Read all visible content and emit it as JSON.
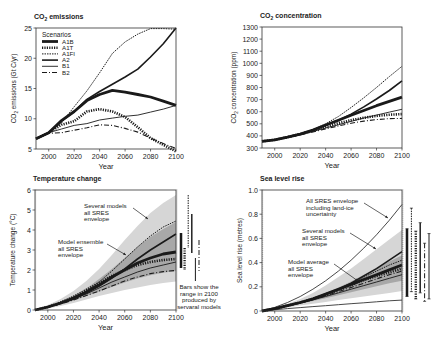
{
  "chart_data": [
    {
      "id": "co2_emissions",
      "type": "line",
      "title": "CO2 emissions",
      "xlabel": "Year",
      "ylabel": "CO2 emissions (Gt C/yr)",
      "xlim": [
        1990,
        2100
      ],
      "ylim": [
        5,
        25
      ],
      "xticks": [
        2000,
        2020,
        2040,
        2060,
        2080,
        2100
      ],
      "yticks": [
        5,
        10,
        15,
        20,
        25
      ],
      "legend": {
        "title": "Scenarios",
        "position": "upper left",
        "entries": [
          "A1B",
          "A1T",
          "A1FI",
          "A2",
          "B1",
          "B2"
        ]
      },
      "x": [
        1990,
        2000,
        2010,
        2020,
        2030,
        2040,
        2050,
        2060,
        2070,
        2080,
        2090,
        2100
      ],
      "series": [
        {
          "name": "A1B",
          "style": "thick-solid",
          "values": [
            6.7,
            7.7,
            9.7,
            11.2,
            13.0,
            14.0,
            14.7,
            14.4,
            14.0,
            13.6,
            12.9,
            12.2
          ]
        },
        {
          "name": "A1T",
          "style": "thick-dotted",
          "values": [
            6.7,
            7.7,
            9.0,
            9.6,
            11.2,
            11.6,
            11.2,
            10.3,
            8.6,
            6.8,
            5.7,
            4.6
          ]
        },
        {
          "name": "A1FI",
          "style": "thin-dotted",
          "values": [
            6.7,
            7.7,
            9.3,
            12.0,
            14.6,
            17.6,
            20.8,
            22.7,
            24.0,
            24.9,
            24.9,
            24.8
          ]
        },
        {
          "name": "A2",
          "style": "solid",
          "values": [
            6.7,
            7.7,
            9.6,
            11.2,
            13.2,
            14.5,
            15.7,
            16.9,
            18.2,
            20.2,
            22.4,
            25.0
          ]
        },
        {
          "name": "B1",
          "style": "thin-solid",
          "values": [
            6.7,
            7.7,
            8.3,
            8.9,
            9.2,
            9.8,
            10.1,
            10.4,
            10.6,
            11.1,
            11.6,
            12.2
          ]
        },
        {
          "name": "B2",
          "style": "dash-dot",
          "values": [
            6.7,
            7.6,
            7.7,
            8.1,
            8.5,
            9.0,
            8.9,
            8.4,
            7.8,
            6.8,
            5.9,
            5.1
          ]
        }
      ]
    },
    {
      "id": "co2_concentration",
      "type": "line",
      "title": "CO2 concentration",
      "xlabel": "Year",
      "ylabel": "CO2 concentration (ppm)",
      "xlim": [
        1990,
        2100
      ],
      "ylim": [
        300,
        1300
      ],
      "xticks": [
        2000,
        2020,
        2040,
        2060,
        2080,
        2100
      ],
      "yticks": [
        300,
        400,
        500,
        600,
        700,
        800,
        900,
        1000,
        1100,
        1200,
        1300
      ],
      "x": [
        1990,
        2000,
        2010,
        2020,
        2030,
        2040,
        2050,
        2060,
        2070,
        2080,
        2090,
        2100
      ],
      "series": [
        {
          "name": "A1B",
          "style": "thick-solid",
          "values": [
            355,
            368,
            390,
            415,
            448,
            490,
            530,
            570,
            610,
            650,
            685,
            720
          ]
        },
        {
          "name": "A1T",
          "style": "thick-dotted",
          "values": [
            355,
            368,
            390,
            415,
            445,
            475,
            505,
            530,
            550,
            565,
            575,
            580
          ]
        },
        {
          "name": "A1FI",
          "style": "thin-dotted",
          "values": [
            355,
            368,
            390,
            415,
            450,
            500,
            560,
            635,
            715,
            800,
            890,
            975
          ]
        },
        {
          "name": "A2",
          "style": "solid",
          "values": [
            355,
            368,
            390,
            415,
            448,
            488,
            530,
            580,
            640,
            705,
            775,
            855
          ]
        },
        {
          "name": "B1",
          "style": "thin-solid",
          "values": [
            355,
            368,
            388,
            410,
            437,
            465,
            492,
            520,
            548,
            572,
            597,
            620
          ]
        },
        {
          "name": "B2",
          "style": "dash-dot",
          "values": [
            355,
            368,
            387,
            408,
            432,
            458,
            482,
            505,
            522,
            535,
            543,
            545
          ]
        }
      ]
    },
    {
      "id": "temperature_change",
      "type": "line",
      "title": "Temperature change",
      "xlabel": "Year",
      "ylabel": "Temperature change (°C)",
      "xlim": [
        1990,
        2100
      ],
      "ylim": [
        0,
        6
      ],
      "xticks": [
        2000,
        2020,
        2040,
        2060,
        2080,
        2100
      ],
      "yticks": [
        0,
        1,
        2,
        3,
        4,
        5,
        6
      ],
      "x": [
        1990,
        2000,
        2010,
        2020,
        2030,
        2040,
        2050,
        2060,
        2070,
        2080,
        2090,
        2100
      ],
      "series": [
        {
          "name": "A1B",
          "style": "thick-solid",
          "values": [
            0,
            0.15,
            0.35,
            0.6,
            0.9,
            1.25,
            1.65,
            2.0,
            2.35,
            2.6,
            2.8,
            2.9
          ]
        },
        {
          "name": "A1T",
          "style": "thick-dotted",
          "values": [
            0,
            0.15,
            0.37,
            0.65,
            1.0,
            1.35,
            1.7,
            2.0,
            2.25,
            2.4,
            2.5,
            2.55
          ]
        },
        {
          "name": "A1FI",
          "style": "thin-dotted",
          "values": [
            0,
            0.15,
            0.35,
            0.6,
            0.95,
            1.4,
            1.95,
            2.55,
            3.15,
            3.7,
            4.15,
            4.45
          ]
        },
        {
          "name": "A2",
          "style": "solid",
          "values": [
            0,
            0.15,
            0.33,
            0.55,
            0.85,
            1.2,
            1.6,
            2.05,
            2.55,
            3.0,
            3.4,
            3.8
          ]
        },
        {
          "name": "B1",
          "style": "thin-solid",
          "values": [
            0,
            0.15,
            0.33,
            0.55,
            0.8,
            1.1,
            1.4,
            1.65,
            1.9,
            2.1,
            2.25,
            2.4
          ]
        },
        {
          "name": "B2",
          "style": "dash-dot",
          "values": [
            0,
            0.13,
            0.3,
            0.5,
            0.72,
            0.95,
            1.2,
            1.45,
            1.65,
            1.82,
            1.92,
            1.98
          ]
        }
      ],
      "envelopes": [
        {
          "name": "Several models all SRES envelope",
          "fill": "#d6d6d6",
          "upper": [
            0,
            0.25,
            0.55,
            0.95,
            1.45,
            2.05,
            2.75,
            3.5,
            4.2,
            4.85,
            5.35,
            5.75
          ],
          "lower": [
            0,
            0.08,
            0.2,
            0.35,
            0.52,
            0.7,
            0.85,
            1.0,
            1.12,
            1.25,
            1.35,
            1.42
          ]
        },
        {
          "name": "Model ensemble all SRES envelope",
          "fill": "#a8a8a8",
          "upper": [
            0,
            0.18,
            0.42,
            0.72,
            1.08,
            1.55,
            2.05,
            2.6,
            3.15,
            3.65,
            4.05,
            4.4
          ],
          "lower": [
            0,
            0.12,
            0.28,
            0.48,
            0.7,
            0.92,
            1.15,
            1.38,
            1.57,
            1.74,
            1.86,
            1.95
          ]
        }
      ],
      "range_bars_2100": [
        {
          "name": "A1B",
          "style": "thick-solid",
          "min": 2.1,
          "max": 3.85
        },
        {
          "name": "A1T",
          "style": "thick-dotted",
          "min": 2.0,
          "max": 3.1
        },
        {
          "name": "A1FI",
          "style": "thin-dotted",
          "min": 3.1,
          "max": 5.75
        },
        {
          "name": "A2",
          "style": "solid",
          "min": 2.85,
          "max": 4.8
        },
        {
          "name": "B1",
          "style": "thin-solid",
          "min": 1.45,
          "max": 2.6
        },
        {
          "name": "B2",
          "style": "dash-dot",
          "min": 1.95,
          "max": 3.5
        }
      ],
      "annotations": [
        "Several models all SRES envelope",
        "Model ensemble all SRES envelope",
        "Bars show the range in 2100 produced by servaral models"
      ]
    },
    {
      "id": "sea_level_rise",
      "type": "line",
      "title": "Sea level rise",
      "xlabel": "Year",
      "ylabel": "Sea level rise (metres)",
      "xlim": [
        1990,
        2100
      ],
      "ylim": [
        0,
        1.0
      ],
      "xticks": [
        2000,
        2020,
        2040,
        2060,
        2080,
        2100
      ],
      "yticks": [
        0,
        0.2,
        0.4,
        0.6,
        0.8,
        1.0
      ],
      "x": [
        1990,
        2000,
        2010,
        2020,
        2030,
        2040,
        2050,
        2060,
        2070,
        2080,
        2090,
        2100
      ],
      "series": [
        {
          "name": "A1B",
          "style": "thick-solid",
          "values": [
            0,
            0.02,
            0.045,
            0.07,
            0.1,
            0.14,
            0.18,
            0.22,
            0.26,
            0.3,
            0.34,
            0.38
          ]
        },
        {
          "name": "A1T",
          "style": "thick-dotted",
          "values": [
            0,
            0.02,
            0.045,
            0.07,
            0.1,
            0.135,
            0.175,
            0.215,
            0.255,
            0.29,
            0.32,
            0.35
          ]
        },
        {
          "name": "A1FI",
          "style": "thin-dotted",
          "values": [
            0,
            0.02,
            0.045,
            0.07,
            0.1,
            0.14,
            0.18,
            0.23,
            0.28,
            0.33,
            0.38,
            0.42
          ]
        },
        {
          "name": "A2",
          "style": "solid",
          "values": [
            0,
            0.02,
            0.045,
            0.07,
            0.1,
            0.14,
            0.18,
            0.23,
            0.29,
            0.35,
            0.42,
            0.49
          ]
        },
        {
          "name": "B1",
          "style": "thin-solid",
          "values": [
            0,
            0.02,
            0.042,
            0.065,
            0.092,
            0.12,
            0.15,
            0.18,
            0.21,
            0.24,
            0.27,
            0.3
          ]
        },
        {
          "name": "B2",
          "style": "dash-dot",
          "values": [
            0,
            0.02,
            0.043,
            0.068,
            0.095,
            0.125,
            0.16,
            0.195,
            0.23,
            0.265,
            0.3,
            0.33
          ]
        }
      ],
      "envelopes": [
        {
          "name": "Several models all SRES envelope",
          "fill": "#d6d6d6",
          "upper": [
            0,
            0.03,
            0.06,
            0.1,
            0.15,
            0.21,
            0.28,
            0.35,
            0.43,
            0.51,
            0.59,
            0.67
          ],
          "lower": [
            0,
            0.015,
            0.03,
            0.045,
            0.06,
            0.075,
            0.09,
            0.105,
            0.12,
            0.135,
            0.15,
            0.165
          ]
        },
        {
          "name": "Model average all SRES envelope",
          "fill": "#a8a8a8",
          "upper": [
            0,
            0.022,
            0.048,
            0.076,
            0.108,
            0.15,
            0.195,
            0.245,
            0.3,
            0.355,
            0.41,
            0.46
          ],
          "lower": [
            0,
            0.018,
            0.038,
            0.06,
            0.082,
            0.105,
            0.13,
            0.155,
            0.18,
            0.205,
            0.23,
            0.25
          ]
        }
      ],
      "outer_lines": [
        {
          "name": "All SRES envelope including land-ice uncertainty (upper)",
          "values": [
            0,
            0.03,
            0.07,
            0.12,
            0.18,
            0.25,
            0.33,
            0.42,
            0.52,
            0.63,
            0.75,
            0.88
          ]
        },
        {
          "name": "All SRES envelope including land-ice uncertainty (lower)",
          "values": [
            0,
            0.01,
            0.02,
            0.028,
            0.036,
            0.044,
            0.052,
            0.06,
            0.068,
            0.076,
            0.084,
            0.09
          ]
        }
      ],
      "range_bars_2100": [
        {
          "name": "A1B",
          "style": "thick-solid",
          "min": 0.12,
          "max": 0.68
        },
        {
          "name": "A1FI",
          "style": "thin-dotted",
          "min": 0.16,
          "max": 0.85
        },
        {
          "name": "A1T",
          "style": "thick-dotted",
          "min": 0.1,
          "max": 0.66
        },
        {
          "name": "A2",
          "style": "solid",
          "min": 0.15,
          "max": 0.73
        },
        {
          "name": "B2",
          "style": "dash-dot",
          "min": 0.08,
          "max": 0.56
        },
        {
          "name": "B1",
          "style": "thin-solid",
          "min": 0.1,
          "max": 0.64
        }
      ],
      "annotations": [
        "All SRES envelope including land-ice uncertainty",
        "Several models all SRES envelope",
        "Model average all SRES envelope"
      ]
    }
  ],
  "labels": {
    "year": "Year",
    "scenarios": "Scenarios",
    "temp_note": [
      "Bars show the",
      "range in 2100",
      "produced by",
      "servaral models"
    ],
    "temp_ann1": [
      "Several models",
      "all SRES",
      "envelope"
    ],
    "temp_ann2": [
      "Model ensemble",
      "all SRES",
      "envelope"
    ],
    "sea_ann1": [
      "All SRES envelope",
      "including land-ice",
      "uncertainty"
    ],
    "sea_ann2": [
      "Several models",
      "all SRES",
      "envelope"
    ],
    "sea_ann3": [
      "Model average",
      "all SRES",
      "envelope"
    ]
  }
}
